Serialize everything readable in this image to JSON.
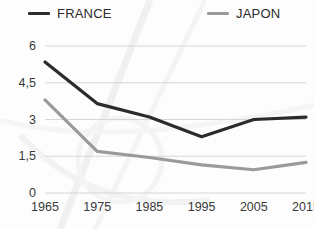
{
  "legend": {
    "position": "top",
    "entries": [
      {
        "label": "FRANCE",
        "color": "#2b2b2b"
      },
      {
        "label": "JAPON",
        "color": "#9a9a9a"
      }
    ]
  },
  "axes": {
    "y_ticks": [
      "0",
      "1,5",
      "3",
      "4,5",
      "6"
    ],
    "x_ticks": [
      "1965",
      "1975",
      "1985",
      "1995",
      "2005",
      "2015"
    ]
  },
  "chart_data": {
    "type": "line",
    "title": "",
    "subtitle": "",
    "xlabel": "",
    "ylabel": "",
    "x": [
      1965,
      1975,
      1985,
      1995,
      2005,
      2015
    ],
    "categories": [
      "1965",
      "1975",
      "1985",
      "1995",
      "2005",
      "2015"
    ],
    "series": [
      {
        "name": "FRANCE",
        "color": "#2b2b2b",
        "values": [
          5.35,
          3.65,
          3.1,
          2.3,
          3.0,
          3.1
        ]
      },
      {
        "name": "JAPON",
        "color": "#9a9a9a",
        "values": [
          3.8,
          1.7,
          1.45,
          1.15,
          0.95,
          1.25
        ]
      }
    ],
    "ylim": [
      0,
      6
    ],
    "ytick_values": [
      0,
      1.5,
      3,
      4.5,
      6
    ],
    "xlim": [
      1965,
      2015
    ],
    "grid": "horizontal",
    "legend_position": "top"
  }
}
